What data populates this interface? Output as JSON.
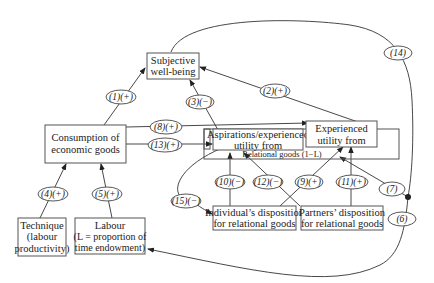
{
  "diagram": {
    "nodes": {
      "subjective_wellbeing": {
        "line1": "Subjective",
        "line2": "well-being"
      },
      "consumption": {
        "line1": "Consumption of",
        "line2": "economic goods"
      },
      "aspirations": {
        "line1": "Aspirations/experienced",
        "line2": "utility from"
      },
      "experienced": {
        "line1": "Experienced",
        "line2": "utility from"
      },
      "relational_goods": {
        "label": "Relational goods (1−L)"
      },
      "technique": {
        "line1": "Technique",
        "line2": "(labour",
        "line3": "productivity)"
      },
      "labour": {
        "line1": "Labour",
        "line2": "(L = proportion of",
        "line3": "time endowment)"
      },
      "individual_disposition": {
        "line1": "Individual’s disposition",
        "line2": "for relational goods"
      },
      "partners_disposition": {
        "line1": "Partners’ disposition",
        "line2": "for relational goods"
      }
    },
    "edge_labels": {
      "e1": "(1)(+)",
      "e2": "(2)(+)",
      "e3": "(3)(−)",
      "e4": "(4)(+)",
      "e5": "(5)(+)",
      "e6": "(6)",
      "e7": "(7)",
      "e8": "(8)(+)",
      "e9": "(9)(+)",
      "e10": "(10)(−)",
      "e11": "(11)(+)",
      "e12": "(12)(−)",
      "e13": "(13)(+)",
      "e14": "(14)",
      "e15": "(15)(−)"
    }
  }
}
